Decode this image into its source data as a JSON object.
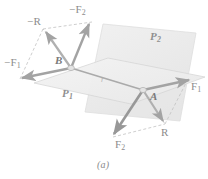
{
  "figure": {
    "caption": "(a)",
    "colors": {
      "plane_fill": "#f2f2f2",
      "plane_fill_upper": "#ededed",
      "plane_edge": "#d8d8d8",
      "vector": "#a8a8a8",
      "vector_dark": "#979797",
      "dashed": "#bfbfbf",
      "label": "#8c8c8c",
      "background": "#ffffff"
    },
    "planes": [
      {
        "id": "P1",
        "label": "P",
        "subscript": "1",
        "label_x": 63,
        "label_y": 93,
        "role": "lower-horizontal-plane"
      },
      {
        "id": "P2",
        "label": "P",
        "subscript": "2",
        "label_x": 151,
        "label_y": 36,
        "role": "upper-inclined-plane"
      }
    ],
    "points": [
      {
        "id": "B",
        "label": "B",
        "x": 71,
        "y": 68,
        "label_x": 56,
        "label_y": 58
      },
      {
        "id": "A",
        "label": "A",
        "x": 143,
        "y": 90,
        "label_x": 150,
        "label_y": 96
      }
    ],
    "distance_label": {
      "text": "r",
      "x": 101,
      "y": 80
    },
    "vectors": [
      {
        "id": "negF1",
        "label": "−F",
        "subscript": "1",
        "from": "B",
        "label_x": 4,
        "label_y": 63,
        "direction": "left"
      },
      {
        "id": "negF2",
        "label": "−F",
        "subscript": "2",
        "from": "B",
        "label_x": 69,
        "label_y": 6,
        "direction": "up-right"
      },
      {
        "id": "negR",
        "label": "−R",
        "subscript": "",
        "from": "B",
        "label_x": 27,
        "label_y": 15,
        "direction": "up-left"
      },
      {
        "id": "F1",
        "label": "F",
        "subscript": "1",
        "from": "A",
        "label_x": 190,
        "label_y": 87,
        "direction": "right"
      },
      {
        "id": "F2",
        "label": "F",
        "subscript": "2",
        "from": "A",
        "label_x": 118,
        "label_y": 142,
        "direction": "down-left"
      },
      {
        "id": "R",
        "label": "R",
        "subscript": "",
        "from": "A",
        "label_x": 161,
        "label_y": 130,
        "direction": "down-right"
      }
    ]
  }
}
